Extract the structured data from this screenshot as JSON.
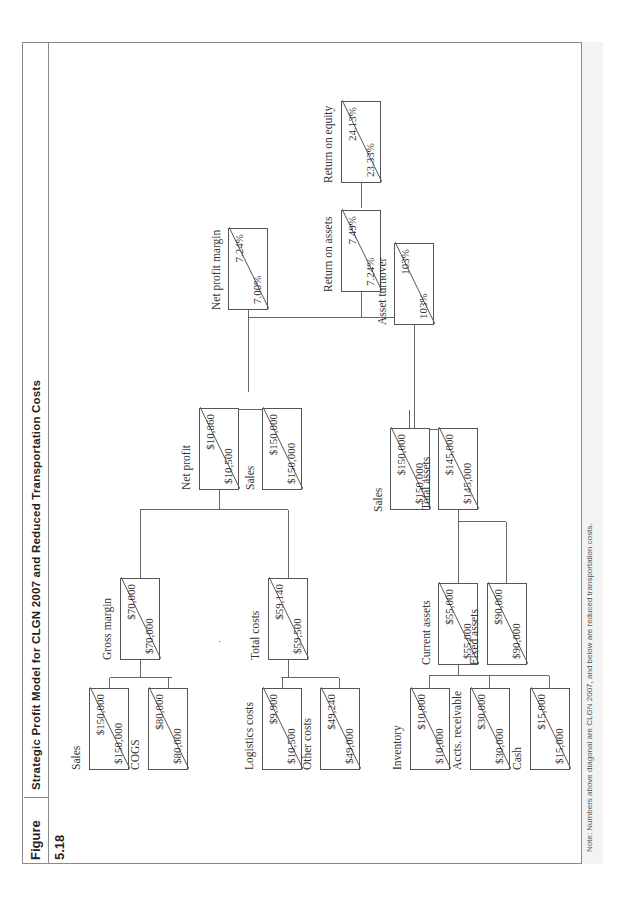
{
  "figure": {
    "number": "Figure 5.18",
    "title": "Strategic Profit Model for CLGN 2007 and Reduced Transportation Costs",
    "note": "Note: Numbers above diagonal are CLGN 2007, and below are reduced transportation costs."
  },
  "nodes": {
    "roe": {
      "label": "Return on equity",
      "above": "23.33%",
      "below": "24.13%"
    },
    "roa": {
      "label": "Return on assets",
      "above": "7.24%",
      "below": "7.49%"
    },
    "npm": {
      "label": "Net profit margin",
      "above": "7.00%",
      "below": "7.24%"
    },
    "at": {
      "label": "Asset turnover",
      "above": "103%",
      "below": "103%"
    },
    "net_profit": {
      "label": "Net profit",
      "above": "$10,500",
      "below": "$10,860"
    },
    "sales_npm": {
      "label": "Sales",
      "above": "$150,000",
      "below": "$150,000"
    },
    "sales_at": {
      "label": "Sales",
      "above": "$150,000",
      "below": "$150,000"
    },
    "total_assets": {
      "label": "Total assets",
      "above": "$145,000",
      "below": "$145,000"
    },
    "gross_margin": {
      "label": "Gross margin",
      "above": "$70,000",
      "below": "$70,000"
    },
    "total_costs": {
      "label": "Total costs",
      "above": "$59,500",
      "below": "$59,140"
    },
    "current_assets": {
      "label": "Current assets",
      "above": "$55,000",
      "below": "$55,000"
    },
    "fixed_assets": {
      "label": "Fixed assets",
      "above": "$90,000",
      "below": "$90,000"
    },
    "sales_gm": {
      "label": "Sales",
      "above": "$150,000",
      "below": "$150,000"
    },
    "cogs": {
      "label": "COGS",
      "above": "$80,000",
      "below": "$80,000"
    },
    "logistics": {
      "label": "Logistics costs",
      "above": "$10,500",
      "below": "$9,900"
    },
    "other_costs": {
      "label": "Other costs",
      "above": "$49,000",
      "below": "$49,240"
    },
    "inventory": {
      "label": "Inventory",
      "above": "$10,000",
      "below": "$10,000"
    },
    "accts_receivable": {
      "label": "Accts. receivable",
      "above": "$30,000",
      "below": "$30,000"
    },
    "cash": {
      "label": "Cash",
      "above": "$15,000",
      "below": "$15,000"
    }
  },
  "colors": {
    "line": "#666666",
    "frame": "#8a8a8a",
    "note_band": "#f3f3f3"
  }
}
